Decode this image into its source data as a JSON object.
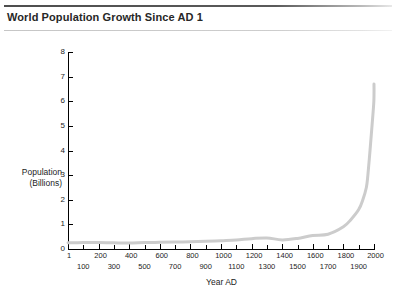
{
  "header": {
    "title": "World Population Growth Since AD 1"
  },
  "chart_data": {
    "type": "line",
    "title": "World Population Growth Since AD 1",
    "xlabel": "Year AD",
    "ylabel": "Population\n(Billions)",
    "ylabel_line1": "Population",
    "ylabel_line2": "(Billions)",
    "xlim": [
      1,
      2000
    ],
    "ylim": [
      0,
      8
    ],
    "grid": false,
    "legend": "none",
    "line_color": "#cccccc",
    "line_width": 3,
    "ytick_labels": [
      "8",
      "7",
      "6",
      "5",
      "4",
      "3",
      "2",
      "1",
      "0"
    ],
    "yticks": [
      8,
      7,
      6,
      5,
      4,
      3,
      2,
      1,
      0
    ],
    "xtick_labels_upper": [
      "1",
      "200",
      "400",
      "600",
      "800",
      "1000",
      "1200",
      "1400",
      "1600",
      "1800",
      "2000"
    ],
    "xtick_labels_lower": [
      "100",
      "300",
      "500",
      "700",
      "900",
      "1100",
      "1300",
      "1500",
      "1700",
      "1900"
    ],
    "xticks": [
      1,
      100,
      200,
      300,
      400,
      500,
      600,
      700,
      800,
      900,
      1000,
      1100,
      1200,
      1300,
      1400,
      1500,
      1600,
      1700,
      1800,
      1900,
      2000
    ],
    "x": [
      1,
      100,
      200,
      300,
      400,
      500,
      600,
      700,
      800,
      900,
      1000,
      1100,
      1200,
      1300,
      1400,
      1500,
      1600,
      1700,
      1800,
      1850,
      1900,
      1927,
      1950,
      1960,
      1974,
      1987,
      1999,
      2000
    ],
    "values": [
      0.25,
      0.26,
      0.26,
      0.25,
      0.24,
      0.26,
      0.27,
      0.28,
      0.29,
      0.31,
      0.34,
      0.37,
      0.42,
      0.45,
      0.37,
      0.43,
      0.55,
      0.6,
      0.9,
      1.2,
      1.6,
      2.0,
      2.5,
      3.0,
      4.0,
      5.0,
      6.0,
      6.7
    ]
  }
}
